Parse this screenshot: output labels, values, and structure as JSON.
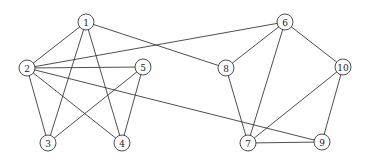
{
  "diagram": {
    "type": "undirected-graph",
    "nodes": [
      {
        "id": "1",
        "label": "1",
        "x": 86,
        "y": 22
      },
      {
        "id": "2",
        "label": "2",
        "x": 27,
        "y": 68
      },
      {
        "id": "3",
        "label": "3",
        "x": 48,
        "y": 143
      },
      {
        "id": "4",
        "label": "4",
        "x": 122,
        "y": 143
      },
      {
        "id": "5",
        "label": "5",
        "x": 143,
        "y": 67
      },
      {
        "id": "6",
        "label": "6",
        "x": 285,
        "y": 22
      },
      {
        "id": "7",
        "label": "7",
        "x": 248,
        "y": 143
      },
      {
        "id": "8",
        "label": "8",
        "x": 226,
        "y": 68
      },
      {
        "id": "9",
        "label": "9",
        "x": 322,
        "y": 142
      },
      {
        "id": "10",
        "label": "10",
        "x": 343,
        "y": 67
      }
    ],
    "edges": [
      [
        "1",
        "2"
      ],
      [
        "1",
        "3"
      ],
      [
        "1",
        "4"
      ],
      [
        "1",
        "8"
      ],
      [
        "2",
        "3"
      ],
      [
        "2",
        "4"
      ],
      [
        "2",
        "5"
      ],
      [
        "2",
        "6"
      ],
      [
        "2",
        "9"
      ],
      [
        "3",
        "5"
      ],
      [
        "4",
        "5"
      ],
      [
        "6",
        "8"
      ],
      [
        "6",
        "7"
      ],
      [
        "6",
        "10"
      ],
      [
        "8",
        "7"
      ],
      [
        "10",
        "7"
      ],
      [
        "10",
        "9"
      ],
      [
        "7",
        "9"
      ]
    ],
    "node_radius": 8,
    "colors": {
      "line": "#3a3a3a",
      "fill": "#ffffff",
      "text": "#222222"
    }
  }
}
